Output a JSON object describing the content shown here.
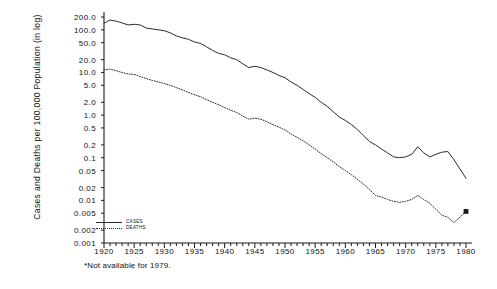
{
  "chart_data": {
    "type": "line",
    "title": "",
    "subtitle": "",
    "xlabel": "",
    "ylabel": "Cases and Deaths per 100,000 Population (in log)",
    "yscale": "log",
    "ylim": [
      0.001,
      200.0
    ],
    "xlim": [
      1920,
      1980
    ],
    "grid": false,
    "legend_position": "bottom-left",
    "ytick_labels": [
      "200.0",
      "100.0",
      "50.0",
      "20.0",
      "10.0",
      "5.0",
      "2.0",
      "1.0",
      "0.5",
      "0.2",
      "0.1",
      "0.05",
      "0.02",
      "0.01",
      "0.005",
      "0.002",
      "0.001"
    ],
    "ytick_values": [
      200.0,
      100.0,
      50.0,
      20.0,
      10.0,
      5.0,
      2.0,
      1.0,
      0.5,
      0.2,
      0.1,
      0.05,
      0.02,
      0.01,
      0.005,
      0.002,
      0.001
    ],
    "xtick_labels": [
      "1920",
      "1925",
      "1930",
      "1935",
      "1940",
      "1945",
      "1950",
      "1955",
      "1960",
      "1965",
      "1970",
      "1975",
      "1980"
    ],
    "xtick_values": [
      1920,
      1925,
      1930,
      1935,
      1940,
      1945,
      1950,
      1955,
      1960,
      1965,
      1970,
      1975,
      1980
    ],
    "annotations": [
      "*Not available for 1979."
    ],
    "series": [
      {
        "name": "CASES",
        "style": "solid",
        "x": [
          1920,
          1921,
          1922,
          1923,
          1924,
          1925,
          1926,
          1927,
          1928,
          1929,
          1930,
          1931,
          1932,
          1933,
          1934,
          1935,
          1936,
          1937,
          1938,
          1939,
          1940,
          1941,
          1942,
          1943,
          1944,
          1945,
          1946,
          1947,
          1948,
          1949,
          1950,
          1951,
          1952,
          1953,
          1954,
          1955,
          1956,
          1957,
          1958,
          1959,
          1960,
          1961,
          1962,
          1963,
          1964,
          1965,
          1966,
          1967,
          1968,
          1969,
          1970,
          1971,
          1972,
          1973,
          1974,
          1975,
          1976,
          1977,
          1978,
          1980
        ],
        "values": [
          142,
          170,
          160,
          145,
          130,
          135,
          130,
          110,
          105,
          100,
          95,
          85,
          72,
          65,
          60,
          52,
          48,
          40,
          33,
          28,
          26,
          22,
          20,
          16,
          13,
          14,
          13,
          11.5,
          10,
          8.5,
          7.5,
          6.0,
          5.0,
          4.0,
          3.2,
          2.6,
          2.0,
          1.6,
          1.2,
          0.9,
          0.75,
          0.6,
          0.46,
          0.33,
          0.24,
          0.2,
          0.16,
          0.13,
          0.105,
          0.1,
          0.105,
          0.12,
          0.18,
          0.13,
          0.105,
          0.12,
          0.135,
          0.14,
          0.09,
          0.033
        ]
      },
      {
        "name": "DEATHS",
        "style": "dotted",
        "x": [
          1920,
          1921,
          1922,
          1923,
          1924,
          1925,
          1926,
          1927,
          1928,
          1929,
          1930,
          1931,
          1932,
          1933,
          1934,
          1935,
          1936,
          1937,
          1938,
          1939,
          1940,
          1941,
          1942,
          1943,
          1944,
          1945,
          1946,
          1947,
          1948,
          1949,
          1950,
          1951,
          1952,
          1953,
          1954,
          1955,
          1956,
          1957,
          1958,
          1959,
          1960,
          1961,
          1962,
          1963,
          1964,
          1965,
          1966,
          1967,
          1968,
          1969,
          1970,
          1971,
          1972,
          1973,
          1974,
          1975,
          1976,
          1977,
          1978,
          1980
        ],
        "values": [
          11.5,
          12.0,
          11.0,
          10.0,
          9.2,
          9.0,
          8.0,
          7.2,
          6.5,
          6.0,
          5.5,
          5.0,
          4.4,
          3.9,
          3.4,
          3.0,
          2.7,
          2.3,
          2.0,
          1.75,
          1.5,
          1.3,
          1.15,
          0.95,
          0.8,
          0.85,
          0.8,
          0.7,
          0.6,
          0.52,
          0.45,
          0.36,
          0.3,
          0.25,
          0.2,
          0.16,
          0.125,
          0.1,
          0.08,
          0.062,
          0.05,
          0.04,
          0.031,
          0.024,
          0.018,
          0.013,
          0.012,
          0.0105,
          0.0095,
          0.009,
          0.0095,
          0.0105,
          0.013,
          0.0105,
          0.0085,
          0.0062,
          0.0045,
          0.004,
          0.003,
          0.0055
        ]
      }
    ],
    "markers": [
      {
        "series": "DEATHS",
        "x": 1980,
        "y": 0.0055,
        "shape": "filled-square"
      }
    ]
  },
  "legend": {
    "cases_label": "CASES",
    "deaths_label": "DEATHS"
  },
  "footnote": "*Not available for 1979."
}
